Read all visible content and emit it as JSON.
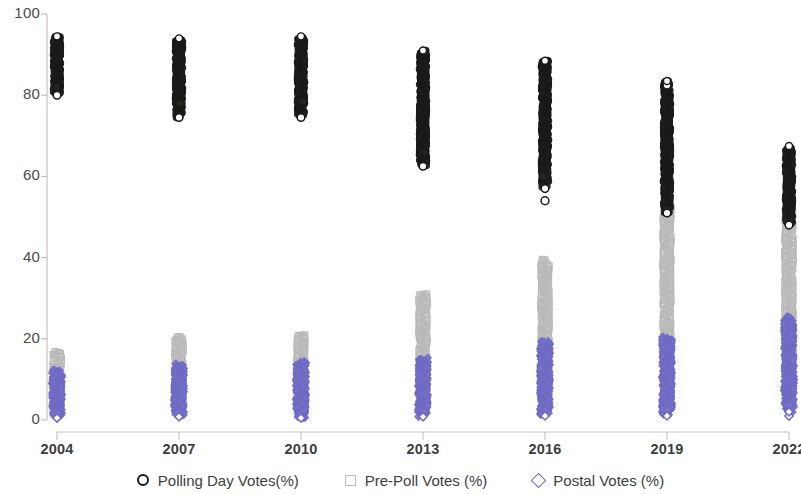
{
  "chart_data": {
    "type": "scatter",
    "title": "",
    "xlabel": "",
    "ylabel": "",
    "categories": [
      "2004",
      "2007",
      "2010",
      "2013",
      "2016",
      "2019",
      "2022"
    ],
    "x_tick_labels": [
      "2004",
      "2007",
      "2010",
      "2013",
      "2016",
      "2019",
      "2022"
    ],
    "y_tick_labels": [
      "0",
      "20",
      "40",
      "60",
      "80",
      "100"
    ],
    "y_ticks": [
      0,
      20,
      40,
      60,
      80,
      100
    ],
    "ylim": [
      0,
      100
    ],
    "grid": false,
    "legend_position": "bottom",
    "legend": [
      {
        "label": "Polling Day Votes(%)",
        "marker": "circle",
        "color": "#1a1a1a"
      },
      {
        "label": "Pre-Poll Votes (%)",
        "marker": "square",
        "color": "#b9b9b9"
      },
      {
        "label": "Postal Votes (%)",
        "marker": "diamond",
        "color": "#6f6bc4"
      }
    ],
    "series": [
      {
        "name": "Polling Day Votes(%)",
        "marker": "circle",
        "color": "#1a1a1a",
        "ranges": [
          {
            "category": "2004",
            "min": 80.0,
            "max": 94.5,
            "dense_min": 82.0,
            "dense_max": 94.0,
            "outliers": []
          },
          {
            "category": "2007",
            "min": 74.5,
            "max": 94.0,
            "dense_min": 78.0,
            "dense_max": 93.5,
            "outliers": []
          },
          {
            "category": "2010",
            "min": 74.5,
            "max": 94.5,
            "dense_min": 78.5,
            "dense_max": 94.0,
            "outliers": []
          },
          {
            "category": "2013",
            "min": 62.5,
            "max": 91.0,
            "dense_min": 66.0,
            "dense_max": 90.5,
            "outliers": []
          },
          {
            "category": "2016",
            "min": 57.0,
            "max": 88.5,
            "dense_min": 60.0,
            "dense_max": 88.0,
            "outliers": [
              54.0
            ]
          },
          {
            "category": "2019",
            "min": 51.0,
            "max": 83.5,
            "dense_min": 52.0,
            "dense_max": 81.0,
            "outliers": [
              82.5
            ]
          },
          {
            "category": "2022",
            "min": 48.0,
            "max": 67.5,
            "dense_min": 49.0,
            "dense_max": 67.0,
            "outliers": []
          }
        ]
      },
      {
        "name": "Pre-Poll Votes (%)",
        "marker": "square",
        "color": "#b9b9b9",
        "ranges": [
          {
            "category": "2004",
            "min": 2.0,
            "max": 17.0,
            "dense_min": 3.0,
            "dense_max": 13.0,
            "outliers": []
          },
          {
            "category": "2007",
            "min": 2.0,
            "max": 20.5,
            "dense_min": 3.0,
            "dense_max": 18.0,
            "outliers": []
          },
          {
            "category": "2010",
            "min": 1.0,
            "max": 21.0,
            "dense_min": 2.0,
            "dense_max": 19.0,
            "outliers": []
          },
          {
            "category": "2013",
            "min": 2.0,
            "max": 31.0,
            "dense_min": 3.0,
            "dense_max": 29.0,
            "outliers": []
          },
          {
            "category": "2016",
            "min": 3.0,
            "max": 39.5,
            "dense_min": 4.0,
            "dense_max": 37.0,
            "outliers": []
          },
          {
            "category": "2019",
            "min": 3.5,
            "max": 52.5,
            "dense_min": 4.5,
            "dense_max": 50.0,
            "outliers": []
          },
          {
            "category": "2022",
            "min": 3.5,
            "max": 53.0,
            "dense_min": 5.0,
            "dense_max": 51.0,
            "outliers": []
          }
        ]
      },
      {
        "name": "Postal Votes (%)",
        "marker": "diamond",
        "color": "#6f6bc4",
        "ranges": [
          {
            "category": "2004",
            "min": 0.5,
            "max": 12.5,
            "dense_min": 1.5,
            "dense_max": 11.0,
            "outliers": []
          },
          {
            "category": "2007",
            "min": 0.8,
            "max": 14.0,
            "dense_min": 2.0,
            "dense_max": 12.5,
            "outliers": []
          },
          {
            "category": "2010",
            "min": 0.5,
            "max": 14.5,
            "dense_min": 1.5,
            "dense_max": 13.0,
            "outliers": []
          },
          {
            "category": "2013",
            "min": 0.8,
            "max": 15.5,
            "dense_min": 2.0,
            "dense_max": 14.0,
            "outliers": []
          },
          {
            "category": "2016",
            "min": 1.0,
            "max": 19.5,
            "dense_min": 2.5,
            "dense_max": 18.0,
            "outliers": []
          },
          {
            "category": "2019",
            "min": 1.0,
            "max": 20.5,
            "dense_min": 2.5,
            "dense_max": 19.0,
            "outliers": []
          },
          {
            "category": "2022",
            "min": 2.0,
            "max": 25.5,
            "dense_min": 3.5,
            "dense_max": 24.0,
            "outliers": [
              1.0
            ]
          }
        ]
      }
    ]
  },
  "axes": {
    "y_axis_name": "y-axis",
    "x_axis_name": "x-axis"
  }
}
